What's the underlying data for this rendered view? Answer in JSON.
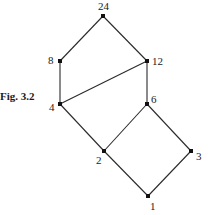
{
  "figure": {
    "caption": "Fig. 3.2"
  },
  "diagram": {
    "type": "hasse-diagram",
    "nodes": [
      {
        "id": "24",
        "label": "24",
        "x": 103,
        "y": 16,
        "lx": 98,
        "ly": 10
      },
      {
        "id": "8",
        "label": "8",
        "x": 60,
        "y": 61,
        "lx": 48,
        "ly": 64
      },
      {
        "id": "12",
        "label": "12",
        "x": 147,
        "y": 61,
        "lx": 152,
        "ly": 65
      },
      {
        "id": "4",
        "label": "4",
        "x": 60,
        "y": 104,
        "lx": 49,
        "ly": 111
      },
      {
        "id": "6",
        "label": "6",
        "x": 147,
        "y": 104,
        "lx": 151,
        "ly": 103
      },
      {
        "id": "2",
        "label": "2",
        "x": 104,
        "y": 151,
        "lx": 96,
        "ly": 164
      },
      {
        "id": "3",
        "label": "3",
        "x": 191,
        "y": 151,
        "lx": 196,
        "ly": 160
      },
      {
        "id": "1",
        "label": "1",
        "x": 148,
        "y": 196,
        "lx": 150,
        "ly": 210
      }
    ],
    "edges": [
      [
        "24",
        "8"
      ],
      [
        "24",
        "12"
      ],
      [
        "8",
        "4"
      ],
      [
        "12",
        "4"
      ],
      [
        "12",
        "6"
      ],
      [
        "4",
        "2"
      ],
      [
        "6",
        "2"
      ],
      [
        "6",
        "3"
      ],
      [
        "2",
        "1"
      ],
      [
        "3",
        "1"
      ]
    ],
    "line_color": "#2a2a2a",
    "node_color": "#111111"
  }
}
